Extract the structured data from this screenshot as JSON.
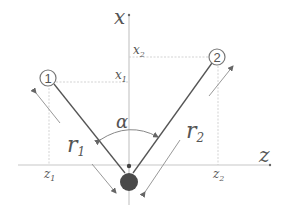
{
  "diagram": {
    "axes": {
      "vertical_label": "x",
      "horizontal_label": "z"
    },
    "points": [
      {
        "id": "1",
        "label": "1",
        "x_label": "x",
        "x_sub": "1",
        "z_label": "z",
        "z_sub": "1"
      },
      {
        "id": "2",
        "label": "2",
        "x_label": "x",
        "x_sub": "2",
        "z_label": "z",
        "z_sub": "2"
      }
    ],
    "lengths": [
      {
        "label": "r",
        "sub": "1"
      },
      {
        "label": "r",
        "sub": "2"
      }
    ],
    "angle_label": "α",
    "colors": {
      "axis": "#c8c8c8",
      "guide": "#d0d0d0",
      "rod": "#555555",
      "dimension": "#8a8a8a",
      "ball": "#4a4a4a",
      "text": "#555555"
    }
  }
}
